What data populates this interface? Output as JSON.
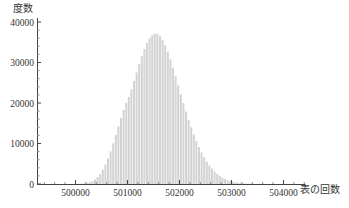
{
  "chart_data": {
    "type": "bar",
    "title": "",
    "xlabel": "表の回数",
    "ylabel": "度数",
    "xlim": [
      499260,
      504400
    ],
    "ylim": [
      0,
      40000
    ],
    "x_ticks": [
      500000,
      501000,
      502000,
      503000,
      504000
    ],
    "x_tick_labels": [
      "500000",
      "501000",
      "502000",
      "503000",
      "504000"
    ],
    "y_ticks": [
      0,
      10000,
      20000,
      30000,
      40000
    ],
    "y_tick_labels": [
      "0",
      "10000",
      "20000",
      "30000",
      "40000"
    ],
    "grid": false,
    "legend": null,
    "bin_width": 50,
    "bar_color": "#d3d3d3",
    "categories": [
      499400,
      499450,
      499500,
      499550,
      499600,
      499650,
      499700,
      499750,
      499800,
      499850,
      499900,
      499950,
      500000,
      500050,
      500100,
      500150,
      500200,
      500250,
      500300,
      500350,
      500400,
      500450,
      500500,
      500550,
      500600,
      500650,
      500700,
      500750,
      500800,
      500850,
      500900,
      500950,
      501000,
      501050,
      501100,
      501150,
      501200,
      501250,
      501300,
      501350,
      501400,
      501450,
      501500,
      501550,
      501600,
      501650,
      501700,
      501750,
      501800,
      501850,
      501900,
      501950,
      502000,
      502050,
      502100,
      502150,
      502200,
      502250,
      502300,
      502350,
      502400,
      502450,
      502500,
      502550,
      502600,
      502650,
      502700,
      502750,
      502800,
      502850,
      502900,
      502950,
      503000,
      503050,
      503100,
      503150,
      503200,
      503250,
      503300,
      503350,
      503400,
      503450,
      503500,
      503550,
      503600,
      503650,
      503700,
      503750,
      503800,
      503850,
      503900,
      503950,
      504000,
      504050,
      504100,
      504150,
      504200,
      504250
    ],
    "values": [
      0,
      0,
      0,
      0,
      0,
      0,
      0,
      0,
      1,
      2,
      5,
      10,
      20,
      40,
      80,
      150,
      260,
      440,
      720,
      1130,
      1710,
      2490,
      3510,
      4780,
      6310,
      8070,
      10030,
      12110,
      14240,
      16330,
      18290,
      20030,
      21500,
      23420,
      25450,
      27530,
      29590,
      31550,
      33320,
      34830,
      36000,
      36780,
      37140,
      37050,
      36520,
      35580,
      34270,
      32650,
      30780,
      28740,
      26580,
      24370,
      22160,
      19990,
      17890,
      15880,
      13980,
      12210,
      10590,
      9110,
      7780,
      6590,
      5530,
      4600,
      3790,
      3090,
      2490,
      1990,
      1570,
      1230,
      950,
      730,
      550,
      410,
      300,
      220,
      160,
      110,
      80,
      50,
      30,
      20,
      10,
      6,
      4,
      2,
      1,
      0,
      0,
      0,
      0,
      0,
      0,
      0,
      0,
      0,
      0,
      0
    ]
  },
  "axes": {
    "ylabel": "度数",
    "xlabel": "表の回数"
  }
}
